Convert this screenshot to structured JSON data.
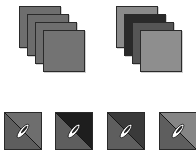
{
  "stacks": [
    {
      "name": "uniform-stack",
      "left": 19,
      "cards": [
        {
          "color": "#6e6e6e"
        },
        {
          "color": "#6c6c6c"
        },
        {
          "color": "#6e6e6e"
        },
        {
          "color": "#737373"
        }
      ]
    },
    {
      "name": "varied-stack",
      "left": 116,
      "cards": [
        {
          "color": "#8a8a8a"
        },
        {
          "color": "#2a2a2a"
        },
        {
          "color": "#555555"
        },
        {
          "color": "#8e8e8e"
        }
      ]
    }
  ],
  "tiles": [
    {
      "left": 4,
      "top_right": "#6e6e6e",
      "bottom_left": "#5e5e5e",
      "icon": "pen-nib-icon"
    },
    {
      "left": 55,
      "top_right": "#1e1e1e",
      "bottom_left": "#5e5e5e",
      "icon": "pen-nib-icon"
    },
    {
      "left": 107,
      "top_right": "#3a3a3a",
      "bottom_left": "#5e5e5e",
      "icon": "pen-nib-icon"
    },
    {
      "left": 159,
      "top_right": "#858585",
      "bottom_left": "#5e5e5e",
      "icon": "pen-nib-icon"
    }
  ]
}
